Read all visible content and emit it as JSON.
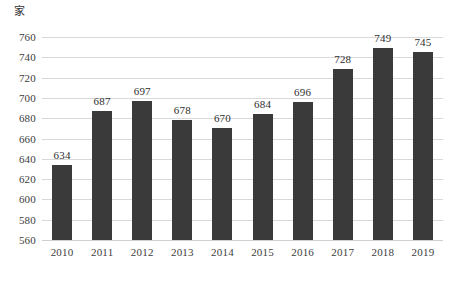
{
  "chart_data": {
    "type": "bar",
    "title": "",
    "subtitle": "",
    "xlabel": "",
    "ylabel": "",
    "unit_label": "家",
    "categories": [
      "2010",
      "2011",
      "2012",
      "2013",
      "2014",
      "2015",
      "2016",
      "2017",
      "2018",
      "2019"
    ],
    "values": [
      634,
      687,
      697,
      678,
      670,
      684,
      696,
      728,
      749,
      745
    ],
    "data_labels": [
      "634",
      "687",
      "697",
      "678",
      "670",
      "684",
      "696",
      "728",
      "749",
      "745"
    ],
    "ylim": [
      560,
      760
    ],
    "ytick_step": 20,
    "yticks": [
      760,
      740,
      720,
      700,
      680,
      660,
      640,
      620,
      600,
      580,
      560
    ],
    "ytick_labels": [
      "760",
      "740",
      "720",
      "700",
      "680",
      "660",
      "640",
      "620",
      "600",
      "580",
      "560"
    ],
    "grid": true,
    "grid_axis": "y",
    "legend": false,
    "legend_position": "none",
    "bar_color": "#3a3a3a",
    "grid_color": "#d9d9d9",
    "background_color": "#ffffff",
    "text_color": "#3d3d3d"
  }
}
